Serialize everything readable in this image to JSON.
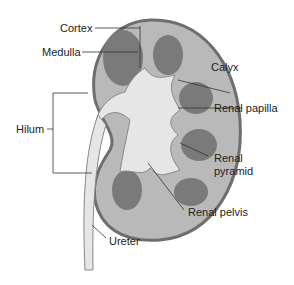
{
  "diagram": {
    "labels": [
      {
        "id": "cortex",
        "text": "Cortex"
      },
      {
        "id": "medulla",
        "text": "Medulla"
      },
      {
        "id": "calyx",
        "text": "Calyx"
      },
      {
        "id": "renal-papilla",
        "text": "Renal papilla"
      },
      {
        "id": "hilum",
        "text": "Hilum"
      },
      {
        "id": "renal-pyramid-1",
        "text": "Renal"
      },
      {
        "id": "renal-pyramid-2",
        "text": "pyramid"
      },
      {
        "id": "renal-pelvis",
        "text": "Renal pelvis"
      },
      {
        "id": "ureter",
        "text": "Ureter"
      }
    ],
    "colors": {
      "capsule": "#6e6e6e",
      "cortex": "#b9b9b9",
      "medulla": "#7a7a7a",
      "pelvis": "#e6e6e6",
      "line": "#333333"
    }
  }
}
